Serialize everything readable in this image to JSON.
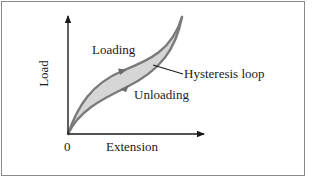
{
  "figure": {
    "type": "hysteresis-diagram",
    "axes": {
      "y_label": "Load",
      "x_label": "Extension",
      "origin_label": "0"
    },
    "annotations": {
      "loading": "Loading",
      "unloading": "Unloading",
      "loop": "Hysteresis loop"
    },
    "colors": {
      "axis": "#1a1a1a",
      "curve_stroke": "#7a7a7a",
      "loop_fill": "#d6d6d6",
      "frame": "#8a8a8a",
      "text": "#1a1a1a"
    },
    "curves": {
      "loading": "M68,134 C78,105 92,84 122,71 C150,60 172,50 182,17",
      "unloading": "M182,17 C176,48 162,70 125,88 C100,100 78,112 68,134"
    }
  }
}
